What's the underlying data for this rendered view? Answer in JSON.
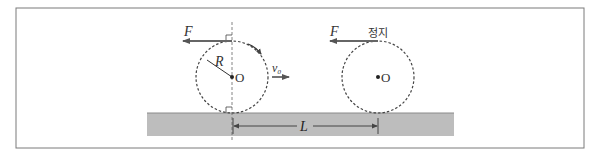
{
  "diagram": {
    "frame": {
      "x": 16,
      "y": 8,
      "w": 568,
      "h": 140,
      "stroke": "#7a7a7a"
    },
    "ground": {
      "x": 147,
      "y": 113,
      "w": 307,
      "h": 23,
      "fill": "#bdbdbd"
    },
    "colors": {
      "line": "#333333",
      "arrow": "#666666",
      "dashed": "#444444"
    },
    "disk_moving": {
      "center": {
        "x": 232,
        "y": 77
      },
      "radius": 36,
      "force_label": "F",
      "radius_label": "R",
      "center_label": "O",
      "velocity_label": "v₀",
      "rotation": "clockwise"
    },
    "disk_stopped": {
      "center": {
        "x": 378,
        "y": 77
      },
      "radius": 36,
      "force_label": "F",
      "state_label": "정지",
      "center_label": "O"
    },
    "distance": {
      "label": "L",
      "x1": 233,
      "x2": 378,
      "y": 126
    }
  }
}
